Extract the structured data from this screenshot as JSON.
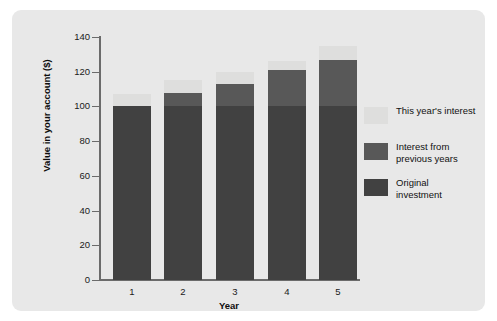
{
  "chart_data": {
    "type": "bar",
    "subtype": "stacked-bar",
    "title": "",
    "xlabel": "Year",
    "ylabel": "Value in your account ($)",
    "categories": [
      "1",
      "2",
      "3",
      "4",
      "5"
    ],
    "ylim": [
      0,
      140
    ],
    "yticks": [
      0,
      20,
      40,
      60,
      80,
      100,
      120,
      140
    ],
    "ytick_labels": [
      "0",
      "20",
      "40",
      "60",
      "80",
      "100",
      "120",
      "140"
    ],
    "grid": false,
    "legend_position": "right",
    "series": [
      {
        "name": "Original investment",
        "color": "#414141",
        "values": [
          100,
          100,
          100,
          100,
          100
        ]
      },
      {
        "name": "Interest from previous years",
        "color": "#585858",
        "values": [
          0,
          8,
          13,
          21,
          27
        ]
      },
      {
        "name": "This year's interest",
        "color": "#dededd",
        "values": [
          7,
          7,
          7,
          5,
          8
        ]
      }
    ],
    "totals": [
      107,
      115,
      120,
      126,
      135
    ]
  },
  "axes": {
    "y_title": "Value in your account ($)",
    "x_title": "Year",
    "y_ticks": [
      "140",
      "120",
      "100",
      "80",
      "60",
      "40",
      "20",
      "0"
    ],
    "x_ticks": [
      "1",
      "2",
      "3",
      "4",
      "5"
    ]
  },
  "legend": {
    "items": [
      {
        "label": "This year's interest",
        "color": "#dededd"
      },
      {
        "label": "Interest from previous years",
        "color": "#585858"
      },
      {
        "label": "Original investment",
        "color": "#414141"
      }
    ]
  },
  "colors": {
    "figure_background": "#e8e8e8",
    "page_background": "#ffffff",
    "axis": "#6b6b6b",
    "text": "#111111"
  }
}
